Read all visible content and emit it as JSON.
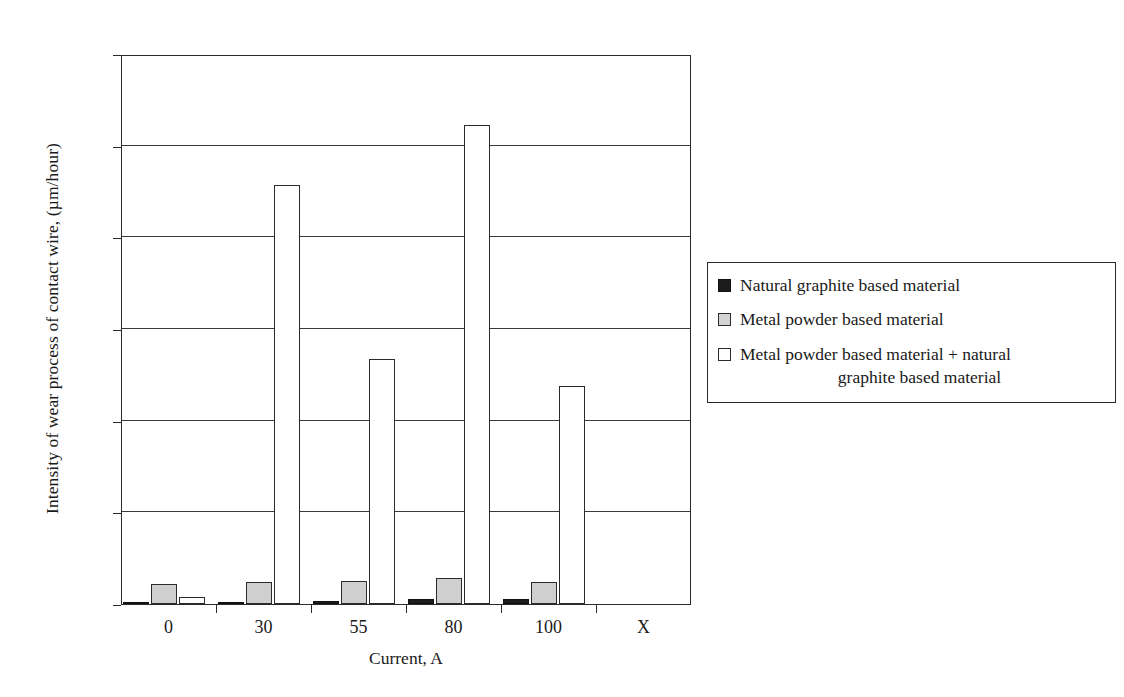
{
  "chart_data": {
    "type": "bar",
    "title": "",
    "xlabel": "Current, A",
    "ylabel": "Intensity of wear process of contact wire, (µm/hour)",
    "categories": [
      "0",
      "30",
      "55",
      "80",
      "100",
      "X"
    ],
    "ylim": [
      0,
      120
    ],
    "yticks": [
      0,
      20,
      40,
      60,
      80,
      100,
      120
    ],
    "ytick_labels": [
      "0",
      "20",
      "40",
      "60",
      "80",
      "100",
      "120"
    ],
    "grid": true,
    "legend_position": "right",
    "series": [
      {
        "name": "Natural graphite based material",
        "swatch": "black",
        "color": "#1c1c1c",
        "values": [
          0.4,
          0.5,
          0.6,
          1.0,
          1.0,
          null
        ]
      },
      {
        "name": "Metal powder based material",
        "swatch": "gray",
        "color": "#cfcfcf",
        "values": [
          4.3,
          4.7,
          5.0,
          5.6,
          4.8,
          null
        ]
      },
      {
        "name": "Metal powder based material + natural graphite based material",
        "swatch": "white",
        "color": "#ffffff",
        "values": [
          1.5,
          91.5,
          53.5,
          104.5,
          47.5,
          null
        ]
      }
    ]
  },
  "legend": {
    "entries": [
      {
        "label": "Natural graphite based material"
      },
      {
        "label": "Metal powder based material"
      },
      {
        "label_line1": "Metal powder based material + natural",
        "label_line2": "graphite based material"
      }
    ]
  },
  "colors": {
    "axis": "#2a2a2a",
    "grid": "#3a3a3a",
    "series_black": "#1c1c1c",
    "series_gray": "#cfcfcf",
    "series_white": "#ffffff",
    "background": "#ffffff"
  }
}
